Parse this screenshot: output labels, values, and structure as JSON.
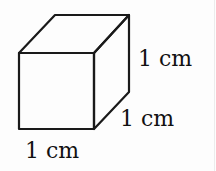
{
  "diagram": {
    "type": "cube",
    "stroke_color": "#1a1a1a",
    "labels": {
      "height": "1 cm",
      "depth": "1 cm",
      "width": "1 cm"
    }
  }
}
